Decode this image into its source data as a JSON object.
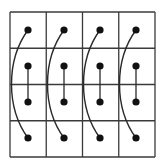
{
  "diagram": {
    "grid": {
      "x0": 10,
      "y0": 12,
      "cell": 36.25,
      "rows": 4,
      "cols": 4,
      "stroke": "#3a3a3a",
      "stroke_width": 1.3
    },
    "dot_color": "#111111",
    "dot_radius": 3.6,
    "line_color": "#2a2a2a",
    "columns": [
      {
        "x": 28,
        "dots_y": [
          30,
          66,
          102,
          138
        ]
      },
      {
        "x": 64,
        "dots_y": [
          30,
          66,
          102,
          138
        ]
      },
      {
        "x": 100,
        "dots_y": [
          30,
          66,
          102,
          138
        ]
      },
      {
        "x": 136,
        "dots_y": [
          30,
          66,
          102,
          138
        ]
      }
    ],
    "connections": [
      {
        "type": "straight",
        "from": "row2",
        "to": "row3"
      },
      {
        "type": "curve-left",
        "from": "row1",
        "to": "row4"
      }
    ]
  }
}
